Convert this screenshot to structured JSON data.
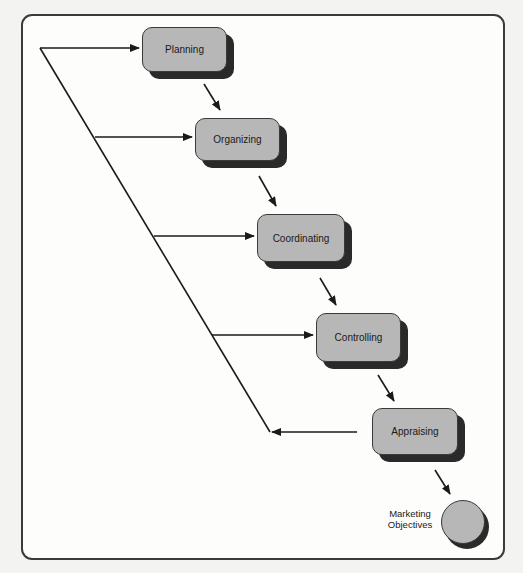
{
  "diagram": {
    "type": "management-process-flow",
    "nodes": [
      {
        "id": "planning",
        "label": "Planning",
        "shape": "rounded-rect",
        "x": 142,
        "y": 27,
        "w": 85,
        "h": 45
      },
      {
        "id": "organizing",
        "label": "Organizing",
        "shape": "rounded-rect",
        "x": 195,
        "y": 118,
        "w": 85,
        "h": 43
      },
      {
        "id": "coordinating",
        "label": "Coordinating",
        "shape": "rounded-rect",
        "x": 257,
        "y": 214,
        "w": 88,
        "h": 48
      },
      {
        "id": "controlling",
        "label": "Controlling",
        "shape": "rounded-rect",
        "x": 316,
        "y": 313,
        "w": 85,
        "h": 49
      },
      {
        "id": "appraising",
        "label": "Appraising",
        "shape": "rounded-rect",
        "x": 372,
        "y": 408,
        "w": 86,
        "h": 47
      },
      {
        "id": "objectives",
        "label_line1": "Marketing",
        "label_line2": "Objectives",
        "shape": "circle"
      }
    ],
    "edges": [
      {
        "from": "planning",
        "to": "organizing"
      },
      {
        "from": "organizing",
        "to": "coordinating"
      },
      {
        "from": "coordinating",
        "to": "controlling"
      },
      {
        "from": "controlling",
        "to": "appraising"
      },
      {
        "from": "appraising",
        "to": "objectives"
      },
      {
        "from": "appraising",
        "to": "feedback-line",
        "kind": "feedback"
      },
      {
        "from": "feedback-line",
        "to": "planning"
      },
      {
        "from": "feedback-line",
        "to": "organizing"
      },
      {
        "from": "feedback-line",
        "to": "coordinating"
      },
      {
        "from": "feedback-line",
        "to": "controlling"
      }
    ]
  }
}
